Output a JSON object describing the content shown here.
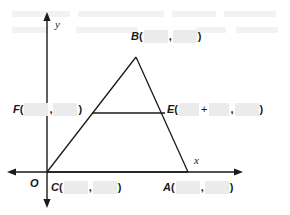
{
  "figure": {
    "type": "geometry-coordinate-plane-triangle",
    "axes": {
      "x_axis_label": "x",
      "y_axis_label": "y",
      "origin_label": "O"
    },
    "points": [
      {
        "id": "B",
        "name": "B",
        "role": "triangle-apex",
        "open_paren": "(",
        "close_paren": ")",
        "comma": ",",
        "coord_x_blank": "",
        "coord_y_blank": "",
        "has_sum": false
      },
      {
        "id": "F",
        "name": "F",
        "role": "midsegment-left-endpoint",
        "open_paren": "(",
        "close_paren": ")",
        "comma": ",",
        "coord_x_blank": "",
        "coord_y_blank": "",
        "has_sum": false
      },
      {
        "id": "E",
        "name": "E",
        "role": "midsegment-right-endpoint",
        "open_paren": "(",
        "close_paren": ")",
        "comma": ",",
        "plus": "+",
        "coord_x_blank": "",
        "coord_x_blank2": "",
        "coord_y_blank": "",
        "has_sum": true
      },
      {
        "id": "C",
        "name": "C",
        "role": "triangle-bottom-left-vertex",
        "open_paren": "(",
        "close_paren": ")",
        "comma": ",",
        "coord_x_blank": "",
        "coord_y_blank": "",
        "has_sum": false
      },
      {
        "id": "A",
        "name": "A",
        "role": "triangle-bottom-right-vertex",
        "open_paren": "(",
        "close_paren": ")",
        "comma": ",",
        "coord_x_blank": "",
        "coord_y_blank": "",
        "has_sum": false
      }
    ],
    "colors": {
      "stroke": "#1a1a1a",
      "blank_fill": "#ebebeb",
      "background": "#ffffff",
      "ghost": "#f2f2f2"
    }
  }
}
